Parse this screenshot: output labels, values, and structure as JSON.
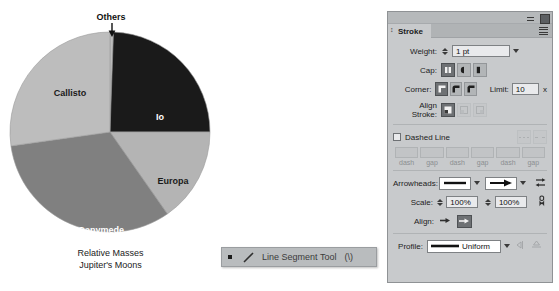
{
  "chart_data": {
    "type": "pie",
    "title": "Relative Masses",
    "subtitle": "Jupiter's Moons",
    "categories": [
      "Others",
      "Io",
      "Europa",
      "Ganymede",
      "Callisto"
    ],
    "values": [
      0.6,
      24.4,
      15.3,
      32.5,
      27.2
    ],
    "colors": [
      "#bdbdbd",
      "#1a1a1a",
      "#b4b4b4",
      "#808080",
      "#bdbdbd"
    ],
    "start_angles_deg": [
      0,
      2,
      90,
      145,
      262
    ],
    "end_angles_deg": [
      2,
      90,
      145,
      262,
      360
    ],
    "legend": "none",
    "annotation": "Others",
    "labels_on_slices": true
  },
  "pie": {
    "caption_line1": "Relative Masses",
    "caption_line2": "Jupiter's Moons",
    "callout": "Others",
    "slices": [
      {
        "name": "Io",
        "label": "Io"
      },
      {
        "name": "Europa",
        "label": "Europa"
      },
      {
        "name": "Ganymede",
        "label": "Ganymede"
      },
      {
        "name": "Callisto",
        "label": "Callisto"
      }
    ]
  },
  "tooltip": {
    "tool_name": "Line Segment Tool",
    "shortcut": "(\\)"
  },
  "stroke_panel": {
    "tab_label": "Stroke",
    "weight": {
      "label": "Weight:",
      "value": "1 pt"
    },
    "cap": {
      "label": "Cap:"
    },
    "corner": {
      "label": "Corner:"
    },
    "limit": {
      "label": "Limit:",
      "value": "10",
      "unit": "x"
    },
    "align_stroke": {
      "label": "Align Stroke:"
    },
    "dashed_line": {
      "label": "Dashed Line"
    },
    "dash_fields": [
      {
        "caption": "dash",
        "value": ""
      },
      {
        "caption": "gap",
        "value": ""
      },
      {
        "caption": "dash",
        "value": ""
      },
      {
        "caption": "gap",
        "value": ""
      },
      {
        "caption": "dash",
        "value": ""
      },
      {
        "caption": "gap",
        "value": ""
      }
    ],
    "arrowheads": {
      "label": "Arrowheads:"
    },
    "scale": {
      "label": "Scale:",
      "start": "100%",
      "end": "100%"
    },
    "align": {
      "label": "Align:"
    },
    "profile": {
      "label": "Profile:",
      "value": "Uniform"
    }
  }
}
